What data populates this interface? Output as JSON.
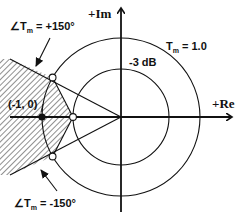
{
  "diagram": {
    "axes": {
      "imag_label": "+Im",
      "real_label": "+Re"
    },
    "circles": [
      {
        "name": "unit-circle",
        "label_main": "T",
        "label_sub": "m",
        "label_rest": " = 1.0",
        "radius_px": 79
      },
      {
        "name": "3db-circle",
        "label": "-3 dB",
        "radius_px": 48
      }
    ],
    "points": {
      "critical": {
        "label": "(-1, 0)"
      }
    },
    "annotations": {
      "upper": {
        "angle_sym": "∠T",
        "sub": "m",
        "rest": " = +150°"
      },
      "lower": {
        "angle_sym": "∠T",
        "sub": "m",
        "rest": " = -150°"
      }
    },
    "colors": {
      "stroke": "#111111",
      "background": "#ffffff"
    }
  }
}
